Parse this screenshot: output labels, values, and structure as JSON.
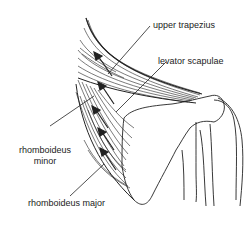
{
  "figure": {
    "labels": {
      "upper_trapezius": "upper trapezius",
      "levator_scapulae": "levator scapulae",
      "rhomboideus_minor_line1": "rhomboideus",
      "rhomboideus_minor_line2": "minor",
      "rhomboideus_major": "rhomboideus major"
    },
    "colors": {
      "line": "#222222",
      "background": "#ffffff"
    }
  }
}
